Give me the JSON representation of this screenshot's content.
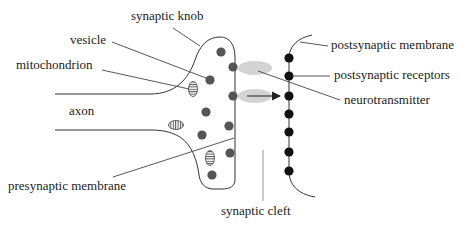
{
  "colors": {
    "line": "#333333",
    "vesicle": "#555555",
    "receptor": "#111111",
    "neurotransmitter": "#d0d0d0",
    "mitochondrion_stripe": "#555555",
    "leader": "#444444",
    "cleft_marker": "#888888"
  },
  "labels": {
    "synaptic_knob": "synaptic knob",
    "vesicle": "vesicle",
    "mitochondrion": "mitochondrion",
    "axon": "axon",
    "presynaptic_membrane": "presynaptic membrane",
    "postsynaptic_membrane": "postsynaptic membrane",
    "postsynaptic_receptors": "postsynaptic receptors",
    "neurotransmitter": "neurotransmitter",
    "synaptic_cleft": "synaptic cleft"
  },
  "structures": {
    "vesicles": [
      {
        "x": 221,
        "y": 52
      },
      {
        "x": 210,
        "y": 80
      },
      {
        "x": 206,
        "y": 112
      },
      {
        "x": 202,
        "y": 135
      },
      {
        "x": 212,
        "y": 175
      },
      {
        "x": 233,
        "y": 67
      },
      {
        "x": 233,
        "y": 96
      },
      {
        "x": 229,
        "y": 126
      },
      {
        "x": 230,
        "y": 153
      }
    ],
    "receptors_y": [
      58,
      76,
      96,
      114,
      132,
      152,
      171
    ],
    "receptor_x": 289,
    "neurotransmitter_blobs": [
      {
        "x": 255,
        "y": 68
      },
      {
        "x": 255,
        "y": 96
      }
    ],
    "mitochondria": [
      {
        "x": 193,
        "y": 89,
        "orientation": "vertical"
      },
      {
        "x": 176,
        "y": 125,
        "orientation": "horizontal"
      },
      {
        "x": 210,
        "y": 158,
        "orientation": "vertical"
      }
    ]
  }
}
